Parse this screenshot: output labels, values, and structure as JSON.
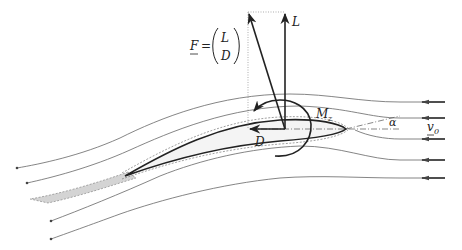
{
  "diagram": {
    "labels": {
      "force_vector": "F",
      "equals": "=",
      "lift_top": "L",
      "drag_bottom": "D",
      "lift": "L",
      "drag": "D",
      "moment": "M",
      "moment_sub": "z",
      "angle_of_attack": "α",
      "freestream_velocity": "v",
      "freestream_sub": "0"
    },
    "elements": [
      {
        "id": "streamlines",
        "count": 9,
        "direction": "right-to-left"
      },
      {
        "id": "airfoil",
        "note": "cambered profile with dashed boundary layer outline"
      },
      {
        "id": "wake",
        "note": "gray shaded wake region behind trailing edge"
      },
      {
        "id": "lift-arrow",
        "direction": "up"
      },
      {
        "id": "resultant-force-arrow",
        "direction": "up-left"
      },
      {
        "id": "drag-arrow",
        "direction": "left"
      },
      {
        "id": "pitching-moment-arc"
      },
      {
        "id": "chord-line",
        "style": "dash-dot"
      },
      {
        "id": "angle-of-attack-line"
      }
    ],
    "colors": {
      "line": "#333333",
      "streamline": "#555555",
      "wake_fill": "#d4d4d4",
      "background": "#ffffff"
    }
  }
}
